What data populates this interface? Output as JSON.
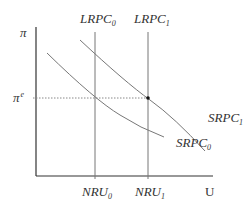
{
  "diagram": {
    "type": "phillips-curve",
    "y_axis_label": "π",
    "x_axis_label": "U",
    "expected_inflation_label": "π",
    "expected_inflation_superscript": "e",
    "curves": {
      "lrpc0": {
        "base": "LRPC",
        "sub": "0"
      },
      "lrpc1": {
        "base": "LRPC",
        "sub": "1"
      },
      "srpc0": {
        "base": "SRPC",
        "sub": "0"
      },
      "srpc1": {
        "base": "SRPC",
        "sub": "1"
      }
    },
    "x_ticks": {
      "nru0": {
        "base": "NRU",
        "sub": "0"
      },
      "nru1": {
        "base": "NRU",
        "sub": "1"
      }
    },
    "colors": {
      "axis": "#333333",
      "curve": "#777777",
      "dotted": "#888888",
      "point": "#111111"
    }
  }
}
